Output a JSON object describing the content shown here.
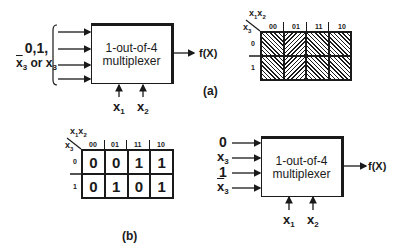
{
  "panel_a": {
    "caption": "(a)",
    "input_label_line1": "0,1,",
    "input_label_line2_prefix": "x",
    "input_label_line2_sub": "3",
    "input_label_line2_mid": " or x",
    "input_label_line2_sub2": "3",
    "mux_label_line1": "1-out-of-4",
    "mux_label_line2": "multiplexer",
    "output_label": "f(X)",
    "select_inputs": [
      {
        "name": "x",
        "sub": "1"
      },
      {
        "name": "x",
        "sub": "2"
      }
    ],
    "kmap": {
      "col_var": "x",
      "col_var_sub1": "1",
      "col_var2": "x",
      "col_var_sub2": "2",
      "row_var": "x",
      "row_var_sub": "3",
      "columns": [
        "00",
        "01",
        "11",
        "10"
      ],
      "rows": [
        "0",
        "1"
      ],
      "cells": [
        [
          "hatched",
          "hatched",
          "hatched",
          "hatched"
        ],
        [
          "hatched",
          "hatched",
          "hatched",
          "hatched"
        ]
      ]
    }
  },
  "panel_b": {
    "caption": "(b)",
    "mux_label_line1": "1-out-of-4",
    "mux_label_line2": "multiplexer",
    "output_label": "f(X)",
    "data_inputs": [
      {
        "text": "0",
        "sub": "",
        "bar": false
      },
      {
        "text": "x",
        "sub": "3",
        "bar": false
      },
      {
        "text": "1",
        "sub": "",
        "bar": false
      },
      {
        "text": "x",
        "sub": "3",
        "bar": true
      }
    ],
    "select_inputs": [
      {
        "name": "x",
        "sub": "1"
      },
      {
        "name": "x",
        "sub": "2"
      }
    ],
    "kmap": {
      "col_var": "x",
      "col_var_sub1": "1",
      "col_var2": "x",
      "col_var_sub2": "2",
      "row_var": "x",
      "row_var_sub": "3",
      "columns": [
        "00",
        "01",
        "11",
        "10"
      ],
      "rows": [
        "0",
        "1"
      ],
      "cells": [
        [
          "0",
          "0",
          "1",
          "1"
        ],
        [
          "0",
          "1",
          "0",
          "1"
        ]
      ]
    }
  }
}
